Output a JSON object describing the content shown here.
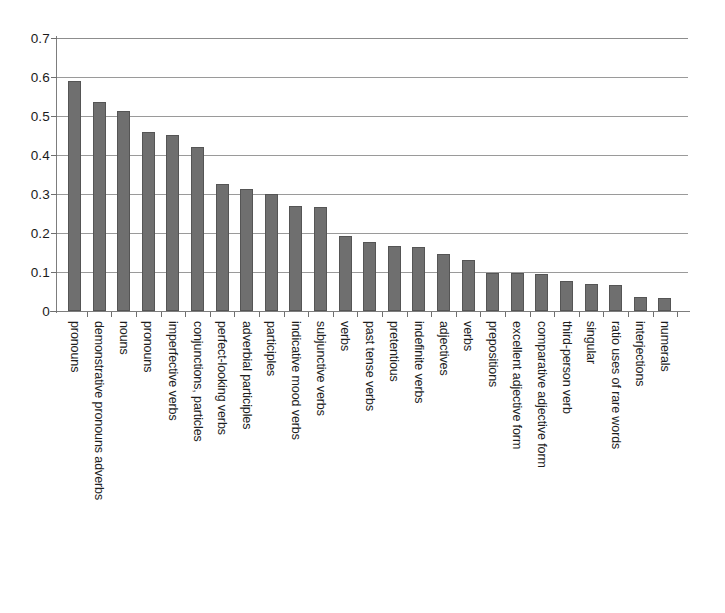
{
  "chart_data": {
    "type": "bar",
    "title": "",
    "subtitle": "",
    "xlabel": "",
    "ylabel": "",
    "ylim": [
      0,
      0.7
    ],
    "ytick_labels": [
      "0",
      "0.1",
      "0.2",
      "0.3",
      "0.4",
      "0.5",
      "0.6",
      "0.7"
    ],
    "ytick_values": [
      0,
      0.1,
      0.2,
      0.3,
      0.4,
      0.5,
      0.6,
      0.7
    ],
    "grid": true,
    "legend": false,
    "legend_position": "none",
    "series_color": "#6f6f6f",
    "categories": [
      "pronouns",
      "demonstrative pronouns adverbs",
      "nouns",
      "pronouns",
      "imperfective verbs",
      "conjunctions, particles",
      "perfect-looking verbs",
      "adverbial participles",
      "participles",
      "indicative mood verbs",
      "subjunctive verbs",
      "verbs",
      "past tense verbs",
      "pretentious",
      "indefinite verbs",
      "adjectives",
      "verbs",
      "prepositions",
      "excellent adjective form",
      "comparative adjective form",
      "third-person verb",
      "singular",
      "ratio uses of rare words",
      "interjections",
      "numerals"
    ],
    "values": [
      0.59,
      0.537,
      0.512,
      0.46,
      0.452,
      0.42,
      0.325,
      0.313,
      0.301,
      0.268,
      0.267,
      0.192,
      0.178,
      0.166,
      0.163,
      0.145,
      0.131,
      0.098,
      0.098,
      0.095,
      0.077,
      0.068,
      0.067,
      0.035,
      0.034
    ]
  }
}
